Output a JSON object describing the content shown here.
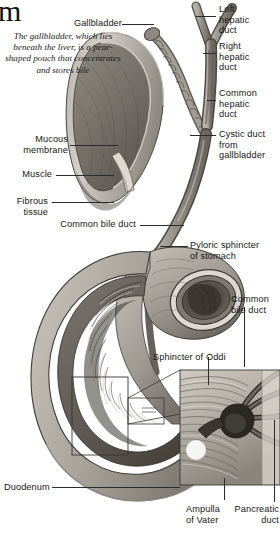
{
  "figure": {
    "corner_glyph": "m",
    "title_fragment": "m",
    "kind": "anatomical-illustration",
    "palette": {
      "ink": "#161616",
      "leader": "#2b2b2b",
      "tissue_light": "#cfcbc4",
      "tissue_mid": "#a8a29a",
      "tissue_dark": "#6e6961",
      "tissue_deep": "#46423c",
      "highlight": "#e8e4dd",
      "paper": "#ffffff"
    }
  },
  "labels": {
    "gallbladder": "Gallbladder",
    "gallbladder_caption": "The gallbladder,\nwhich lies beneath\nthe liver, is a pear-\nshaped pouch that\nconcentrates and\nstores bile",
    "mucous_membrane": "Mucous\nmembrane",
    "muscle": "Muscle",
    "fibrous_tissue": "Fibrous\ntissue",
    "common_bile_duct_left": "Common bile duct",
    "left_hepatic_duct": "Left\nhepatic\nduct",
    "right_hepatic_duct": "Right\nhepatic\nduct",
    "common_hepatic_duct": "Common\nhepatic\nduct",
    "cystic_duct": "Cystic duct\nfrom\ngallbladder",
    "pyloric_sphincter": "Pyloric sphincter\nof stomach",
    "common_bile_duct_right": "Common\nbile duct",
    "sphincter_of_oddi": "Sphincter of Oddi",
    "duodenum": "Duodenum",
    "ampulla_of_vater": "Ampulla\nof Vater",
    "pancreatic_duct": "Pancreatic\nduct"
  },
  "insets": {
    "detail_box_label": "magnified-detail-region",
    "count": 2
  }
}
